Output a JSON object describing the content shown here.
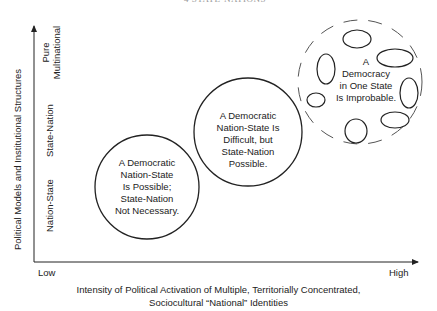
{
  "header": {
    "text": "4    STATE-NATIONS"
  },
  "y_axis": {
    "title": "Political Models and Institutional Structures",
    "ticks": [
      "Nation-State",
      "State-Nation",
      "Pure Multinational"
    ]
  },
  "x_axis": {
    "low": "Low",
    "high": "High",
    "title_line1": "Intensity of Political Activation of Multiple, Territorially Concentrated,",
    "title_line2": "Sociocultural “National” Identities"
  },
  "circles": [
    {
      "lines": [
        "A Democratic",
        "Nation-State",
        "Is Possible;",
        "State-Nation",
        "Not Necessary."
      ]
    },
    {
      "lines": [
        "A Democratic",
        "Nation-State Is",
        "Difficult, but",
        "State-Nation",
        "Possible."
      ]
    },
    {
      "lines": [
        "A",
        "Democracy",
        "in One State",
        "Is Improbable."
      ]
    }
  ],
  "colors": {
    "stroke": "#222222",
    "text": "#222222"
  }
}
